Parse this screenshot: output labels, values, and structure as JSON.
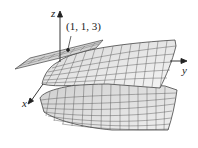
{
  "figure": {
    "type": "3d-surface-with-tangent-plane",
    "axes": {
      "x_label": "x",
      "y_label": "y",
      "z_label": "z"
    },
    "point_label": "(1, 1, 3)",
    "colors": {
      "surface_fill": "#e4e4e4",
      "mesh": "#444444",
      "axis": "#222222",
      "plane_fill": "#cfcfcf"
    }
  }
}
